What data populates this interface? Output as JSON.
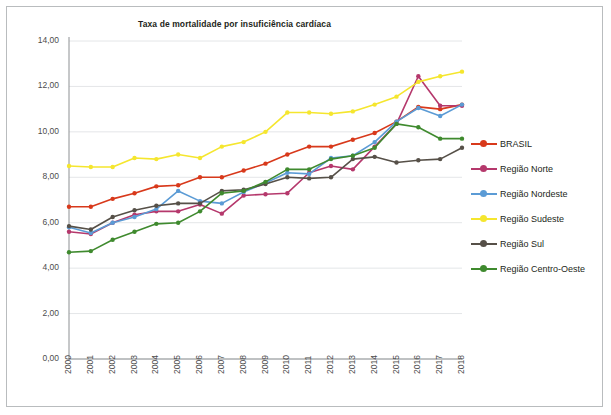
{
  "chart": {
    "title": "Taxa de mortalidade por insuficiência cardíaca"
  },
  "axes": {
    "y_ticks": [
      "0,00",
      "2,00",
      "4,00",
      "6,00",
      "8,00",
      "10,00",
      "12,00",
      "14,00"
    ],
    "x_ticks": [
      "2000",
      "2001",
      "2002",
      "2003",
      "2004",
      "2005",
      "2006",
      "2007",
      "2008",
      "2009",
      "2010",
      "2011",
      "2012",
      "2013",
      "2014",
      "2015",
      "2016",
      "2017",
      "2018"
    ]
  },
  "legend": {
    "items": [
      {
        "label": "BRASIL",
        "color": "#d8391b"
      },
      {
        "label": "Região Norte",
        "color": "#b5386c"
      },
      {
        "label": "Região Nordeste",
        "color": "#5b9bd5"
      },
      {
        "label": "Região Sudeste",
        "color": "#f5e62e"
      },
      {
        "label": "Região Sul",
        "color": "#565048"
      },
      {
        "label": "Região Centro-Oeste",
        "color": "#3f8a2e"
      }
    ]
  },
  "chart_data": {
    "type": "line",
    "title": "Taxa de mortalidade por insuficiência cardíaca",
    "xlabel": "",
    "ylabel": "",
    "xlim": [
      2000,
      2018
    ],
    "ylim": [
      0,
      14
    ],
    "ytick_step": 2,
    "grid": true,
    "legend_position": "right",
    "x": [
      2000,
      2001,
      2002,
      2003,
      2004,
      2005,
      2006,
      2007,
      2008,
      2009,
      2010,
      2011,
      2012,
      2013,
      2014,
      2015,
      2016,
      2017,
      2018
    ],
    "series": [
      {
        "name": "BRASIL",
        "color": "#d8391b",
        "values": [
          6.7,
          6.7,
          7.05,
          7.3,
          7.6,
          7.65,
          8.0,
          8.0,
          8.3,
          8.6,
          9.0,
          9.35,
          9.35,
          9.65,
          9.95,
          10.45,
          11.1,
          11.0,
          11.2
        ]
      },
      {
        "name": "Região Norte",
        "color": "#b5386c",
        "values": [
          5.6,
          5.5,
          6.0,
          6.35,
          6.5,
          6.5,
          6.8,
          6.4,
          7.2,
          7.25,
          7.3,
          8.2,
          8.5,
          8.35,
          9.35,
          10.35,
          12.45,
          11.15,
          11.15
        ]
      },
      {
        "name": "Região Nordeste",
        "color": "#5b9bd5",
        "values": [
          5.8,
          5.55,
          6.0,
          6.25,
          6.6,
          7.4,
          6.95,
          6.85,
          7.35,
          7.75,
          8.2,
          8.15,
          8.85,
          8.95,
          9.55,
          10.45,
          11.05,
          10.7,
          11.2
        ]
      },
      {
        "name": "Região Sudeste",
        "color": "#f5e62e",
        "values": [
          8.5,
          8.45,
          8.45,
          8.85,
          8.8,
          9.0,
          8.85,
          9.35,
          9.55,
          10.0,
          10.85,
          10.85,
          10.8,
          10.9,
          11.2,
          11.55,
          12.2,
          12.45,
          12.65
        ]
      },
      {
        "name": "Região Sul",
        "color": "#565048",
        "values": [
          5.85,
          5.7,
          6.25,
          6.55,
          6.75,
          6.85,
          6.85,
          7.4,
          7.45,
          7.7,
          8.0,
          7.95,
          8.0,
          8.8,
          8.9,
          8.65,
          8.75,
          8.8,
          9.3
        ]
      },
      {
        "name": "Região Centro-Oeste",
        "color": "#3f8a2e",
        "values": [
          4.7,
          4.75,
          5.25,
          5.6,
          5.95,
          6.0,
          6.5,
          7.3,
          7.4,
          7.8,
          8.35,
          8.35,
          8.8,
          8.95,
          9.3,
          10.35,
          10.2,
          9.7,
          9.7
        ]
      }
    ]
  }
}
